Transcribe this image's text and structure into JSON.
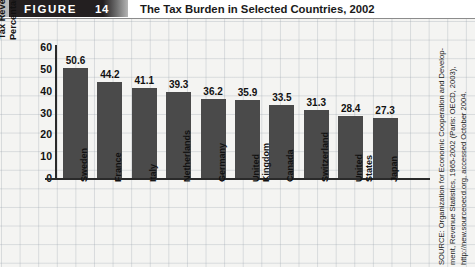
{
  "figure": {
    "label": "FIGURE",
    "number": "14",
    "title": "The Tax Burden in Selected Countries, 2002"
  },
  "source": {
    "lines": [
      "SOURCE: Organization for Economic Cooperation and Develop-",
      "ment, Revenue Statistics, 1965-2002 (Paris: OECD, 2003),",
      "http://new.sourceoecd.org, accessed October 2004."
    ]
  },
  "colors": {
    "bar": "#4a4a4a",
    "band": "#231f20",
    "axis": "#2a2a2a",
    "background": "#f2f2f0"
  },
  "chart_data": {
    "type": "bar",
    "title": "The Tax Burden in Selected Countries, 2002",
    "xlabel": "",
    "ylabel": "Tax Revenues as a\nPercentage of GDP",
    "ylim": [
      0,
      60
    ],
    "yticks": [
      "60",
      "50",
      "40",
      "30",
      "20",
      "10",
      "0"
    ],
    "grid": true,
    "legend": "none",
    "categories": [
      "Sweden",
      "France",
      "Italy",
      "Netherlands",
      "Germany",
      "United\nKingdom",
      "Canada",
      "Switzerland",
      "United\nStates",
      "Japan"
    ],
    "values": [
      50.6,
      44.2,
      41.1,
      39.3,
      36.2,
      35.9,
      33.5,
      31.3,
      28.4,
      27.3
    ],
    "value_labels": [
      "50.6",
      "44.2",
      "41.1",
      "39.3",
      "36.2",
      "35.9",
      "33.5",
      "31.3",
      "28.4",
      "27.3"
    ]
  }
}
